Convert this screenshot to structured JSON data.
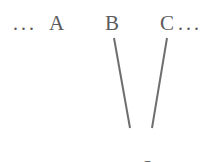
{
  "figure": {
    "background_color": "#ffffff",
    "text_color": "#5c5c5c",
    "edge_color": "#6e6e6e",
    "width": 211,
    "height": 162
  },
  "nodes": {
    "ellipsis_left": "...",
    "a": "A",
    "b": "B",
    "c": "C",
    "ellipsis_right": "..."
  },
  "trace": {
    "label": "<t2>"
  },
  "chart_data": {
    "type": "diagram",
    "title": "",
    "nodes": [
      {
        "id": "ellipsis_left",
        "label": "...",
        "x": 26,
        "y": 23,
        "kind": "ellipsis"
      },
      {
        "id": "A",
        "label": "A",
        "x": 59,
        "y": 23,
        "kind": "terminal"
      },
      {
        "id": "B",
        "label": "B",
        "x": 114,
        "y": 23,
        "kind": "terminal"
      },
      {
        "id": "C",
        "label": "C",
        "x": 169,
        "y": 23,
        "kind": "terminal"
      },
      {
        "id": "ellipsis_right",
        "label": "...",
        "x": 192,
        "y": 23,
        "kind": "ellipsis"
      },
      {
        "id": "t2",
        "label": "<t2>",
        "x": 140,
        "y": 144,
        "kind": "trace"
      }
    ],
    "edges": [
      {
        "from": "B",
        "to": "t2",
        "x1": 114,
        "y1": 38,
        "x2": 130,
        "y2": 128,
        "color": "#6e6e6e",
        "width": 2
      },
      {
        "from": "C",
        "to": "t2",
        "x1": 167,
        "y1": 38,
        "x2": 152,
        "y2": 128,
        "color": "#6e6e6e",
        "width": 2
      }
    ],
    "xlabel": "",
    "ylabel": "",
    "grid": false,
    "legend": null
  }
}
